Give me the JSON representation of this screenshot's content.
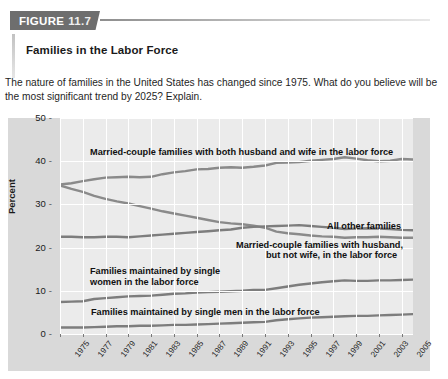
{
  "figure": {
    "tag_word": "FIGURE",
    "tag_number": "11.7",
    "title": "Families in the Labor Force",
    "description": "The nature of families in the United States has changed since 1975. What do you believe will be the most significant trend by 2025? Explain."
  },
  "chart_data": {
    "type": "line",
    "title": "Families in the Labor Force",
    "xlabel": "",
    "ylabel": "Percent",
    "xlim": [
      1975,
      2006
    ],
    "ylim": [
      0,
      50
    ],
    "grid": true,
    "legend_position": "inline-annotations",
    "ytick_labels": [
      "0",
      "10",
      "20",
      "30",
      "40",
      "50"
    ],
    "ytick_values": [
      0,
      10,
      20,
      30,
      40,
      50
    ],
    "xtick_labels": [
      "1975",
      "1977",
      "1979",
      "1981",
      "1983",
      "1985",
      "1987",
      "1989",
      "1991",
      "1993",
      "1995",
      "1997",
      "1999",
      "2001",
      "2003",
      "2005"
    ],
    "x": [
      1975,
      1976,
      1977,
      1978,
      1979,
      1980,
      1981,
      1982,
      1983,
      1984,
      1985,
      1986,
      1987,
      1988,
      1989,
      1990,
      1991,
      1992,
      1993,
      1994,
      1995,
      1996,
      1997,
      1998,
      1999,
      2000,
      2001,
      2002,
      2003,
      2004,
      2005,
      2006
    ],
    "series": [
      {
        "name": "Married-couple families with both husband and wife in the labor force",
        "color": "#8a8a8a",
        "values": [
          34.6,
          34.9,
          35.4,
          35.8,
          36.2,
          36.3,
          36.4,
          36.3,
          36.4,
          37.0,
          37.4,
          37.7,
          38.1,
          38.2,
          38.5,
          38.6,
          38.5,
          38.7,
          39.0,
          39.6,
          39.7,
          39.8,
          40.1,
          40.3,
          40.5,
          40.9,
          40.6,
          40.2,
          40.0,
          40.1,
          40.5,
          40.4
        ]
      },
      {
        "name": "Married-couple families with husband, but not wife, in the labor force",
        "color": "#8a8a8a",
        "values": [
          34.4,
          33.6,
          32.9,
          32.0,
          31.3,
          30.7,
          30.2,
          29.6,
          29.0,
          28.4,
          27.9,
          27.4,
          26.9,
          26.4,
          25.9,
          25.6,
          25.4,
          25.1,
          24.6,
          23.7,
          23.3,
          23.1,
          22.8,
          22.6,
          22.5,
          22.3,
          22.4,
          22.4,
          22.5,
          22.4,
          22.3,
          22.3
        ]
      },
      {
        "name": "All other families",
        "color": "#7d7d7d",
        "values": [
          22.5,
          22.5,
          22.4,
          22.4,
          22.5,
          22.5,
          22.4,
          22.6,
          22.8,
          23.0,
          23.2,
          23.4,
          23.6,
          23.8,
          24.0,
          24.2,
          24.6,
          24.8,
          24.9,
          25.0,
          25.1,
          25.2,
          25.0,
          24.8,
          24.6,
          24.3,
          24.4,
          24.5,
          24.4,
          24.3,
          24.1,
          24.0
        ]
      },
      {
        "name": "Families maintained by single women in the labor force",
        "color": "#7d7d7d",
        "values": [
          7.4,
          7.5,
          7.6,
          8.1,
          8.3,
          8.5,
          8.7,
          8.8,
          8.9,
          9.1,
          9.3,
          9.4,
          9.6,
          9.7,
          9.8,
          9.9,
          10.0,
          10.2,
          10.2,
          10.6,
          11.0,
          11.4,
          11.7,
          12.0,
          12.2,
          12.4,
          12.3,
          12.3,
          12.4,
          12.4,
          12.5,
          12.6
        ]
      },
      {
        "name": "Families maintained by single men in the labor force",
        "color": "#7d7d7d",
        "values": [
          1.5,
          1.5,
          1.5,
          1.6,
          1.7,
          1.8,
          1.8,
          1.9,
          1.9,
          2.0,
          2.1,
          2.1,
          2.2,
          2.3,
          2.4,
          2.5,
          2.6,
          2.7,
          2.8,
          3.2,
          3.4,
          3.6,
          3.8,
          3.9,
          4.0,
          4.1,
          4.2,
          4.2,
          4.3,
          4.4,
          4.5,
          4.6
        ]
      }
    ],
    "annotations": [
      {
        "id": "ann-married-both",
        "text": "Married-couple families with both husband and wife in the labor force",
        "x_px": 90,
        "y_px": 147
      },
      {
        "id": "ann-all-other",
        "text": "All other families",
        "x_px": 327,
        "y_px": 221
      },
      {
        "id": "ann-married-husband-line1",
        "text": "Married-couple families with husband,",
        "x_px": 236,
        "y_px": 240
      },
      {
        "id": "ann-married-husband-line2",
        "text": "but not wife, in the labor force",
        "x_px": 266,
        "y_px": 250
      },
      {
        "id": "ann-single-women-line1",
        "text": "Families maintained by single",
        "x_px": 90,
        "y_px": 266
      },
      {
        "id": "ann-single-women-line2",
        "text": "women in the labor force",
        "x_px": 90,
        "y_px": 277
      },
      {
        "id": "ann-single-men",
        "text": "Families maintained by single men in the labor force",
        "x_px": 91,
        "y_px": 307
      }
    ]
  }
}
